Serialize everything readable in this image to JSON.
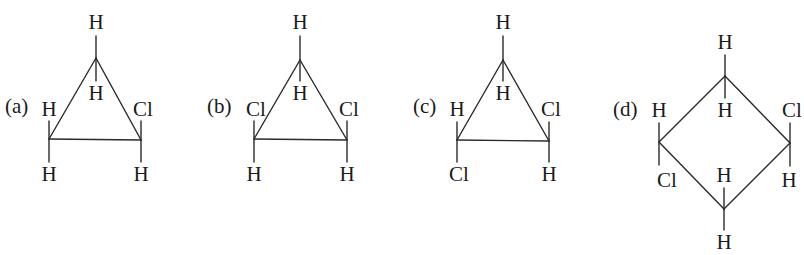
{
  "figure": {
    "cutoff_text_visible": false
  },
  "structures": [
    {
      "id": "a",
      "label": "(a)",
      "label_pos": [
        5,
        113
      ],
      "ring": "cyclopropane",
      "carbons": [
        [
          96,
          58
        ],
        [
          49,
          139
        ],
        [
          141,
          140
        ]
      ],
      "ring_bonds": [
        [
          0,
          1
        ],
        [
          1,
          2
        ],
        [
          2,
          0
        ]
      ],
      "substituents": [
        {
          "text": "H",
          "carbon": 0,
          "pos": [
            96,
            29
          ],
          "bond_end": [
            96,
            36
          ]
        },
        {
          "text": "H",
          "carbon": 0,
          "pos": [
            96,
            100
          ],
          "bond_end": [
            96,
            81
          ]
        },
        {
          "text": "H",
          "carbon": 1,
          "pos": [
            49,
            116
          ],
          "bond_end": [
            49,
            121
          ]
        },
        {
          "text": "H",
          "carbon": 1,
          "pos": [
            49,
            181
          ],
          "bond_end": [
            49,
            162
          ]
        },
        {
          "text": "Cl",
          "carbon": 2,
          "pos": [
            143,
            116
          ],
          "bond_end": [
            141,
            121
          ]
        },
        {
          "text": "H",
          "carbon": 2,
          "pos": [
            141,
            181
          ],
          "bond_end": [
            141,
            162
          ]
        }
      ]
    },
    {
      "id": "b",
      "label": "(b)",
      "label_pos": [
        207,
        113
      ],
      "ring": "cyclopropane",
      "carbons": [
        [
          300,
          60
        ],
        [
          254,
          139
        ],
        [
          347,
          140
        ]
      ],
      "ring_bonds": [
        [
          0,
          1
        ],
        [
          1,
          2
        ],
        [
          2,
          0
        ]
      ],
      "substituents": [
        {
          "text": "H",
          "carbon": 0,
          "pos": [
            300,
            29
          ],
          "bond_end": [
            300,
            36
          ]
        },
        {
          "text": "H",
          "carbon": 0,
          "pos": [
            300,
            100
          ],
          "bond_end": [
            300,
            81
          ]
        },
        {
          "text": "Cl",
          "carbon": 1,
          "pos": [
            256,
            116
          ],
          "bond_end": [
            254,
            121
          ]
        },
        {
          "text": "H",
          "carbon": 1,
          "pos": [
            254,
            181
          ],
          "bond_end": [
            254,
            162
          ]
        },
        {
          "text": "Cl",
          "carbon": 2,
          "pos": [
            349,
            116
          ],
          "bond_end": [
            347,
            121
          ]
        },
        {
          "text": "H",
          "carbon": 2,
          "pos": [
            347,
            181
          ],
          "bond_end": [
            347,
            162
          ]
        }
      ]
    },
    {
      "id": "c",
      "label": "(c)",
      "label_pos": [
        413,
        113
      ],
      "ring": "cyclopropane",
      "carbons": [
        [
          503,
          60
        ],
        [
          457,
          140
        ],
        [
          549,
          141
        ]
      ],
      "ring_bonds": [
        [
          0,
          1
        ],
        [
          1,
          2
        ],
        [
          2,
          0
        ]
      ],
      "substituents": [
        {
          "text": "H",
          "carbon": 0,
          "pos": [
            503,
            29
          ],
          "bond_end": [
            503,
            36
          ]
        },
        {
          "text": "H",
          "carbon": 0,
          "pos": [
            503,
            100
          ],
          "bond_end": [
            503,
            81
          ]
        },
        {
          "text": "H",
          "carbon": 1,
          "pos": [
            457,
            116
          ],
          "bond_end": [
            457,
            122
          ]
        },
        {
          "text": "Cl",
          "carbon": 1,
          "pos": [
            459,
            181
          ],
          "bond_end": [
            457,
            162
          ]
        },
        {
          "text": "Cl",
          "carbon": 2,
          "pos": [
            551,
            116
          ],
          "bond_end": [
            549,
            122
          ]
        },
        {
          "text": "H",
          "carbon": 2,
          "pos": [
            549,
            181
          ],
          "bond_end": [
            549,
            162
          ]
        }
      ]
    },
    {
      "id": "d",
      "label": "(d)",
      "label_pos": [
        613,
        116
      ],
      "ring": "cyclobutane",
      "carbons": [
        [
          725,
          76
        ],
        [
          659,
          142
        ],
        [
          790,
          143
        ],
        [
          724,
          209
        ]
      ],
      "ring_bonds": [
        [
          0,
          1
        ],
        [
          0,
          2
        ],
        [
          1,
          3
        ],
        [
          2,
          3
        ]
      ],
      "substituents": [
        {
          "text": "H",
          "carbon": 0,
          "pos": [
            725,
            49
          ],
          "bond_end": [
            725,
            55
          ]
        },
        {
          "text": "H",
          "carbon": 0,
          "pos": [
            725,
            117
          ],
          "bond_end": [
            725,
            98
          ]
        },
        {
          "text": "H",
          "carbon": 1,
          "pos": [
            659,
            117
          ],
          "bond_end": [
            659,
            123
          ]
        },
        {
          "text": "Cl",
          "carbon": 1,
          "pos": [
            667,
            187
          ],
          "bond_end": [
            659,
            165
          ]
        },
        {
          "text": "Cl",
          "carbon": 2,
          "pos": [
            792,
            117
          ],
          "bond_end": [
            790,
            123
          ]
        },
        {
          "text": "H",
          "carbon": 2,
          "pos": [
            789,
            187
          ],
          "bond_end": [
            790,
            166
          ]
        },
        {
          "text": "H",
          "carbon": 3,
          "pos": [
            724,
            182
          ],
          "bond_end": [
            724,
            188
          ]
        },
        {
          "text": "H",
          "carbon": 3,
          "pos": [
            724,
            249
          ],
          "bond_end": [
            724,
            230
          ]
        }
      ]
    }
  ]
}
